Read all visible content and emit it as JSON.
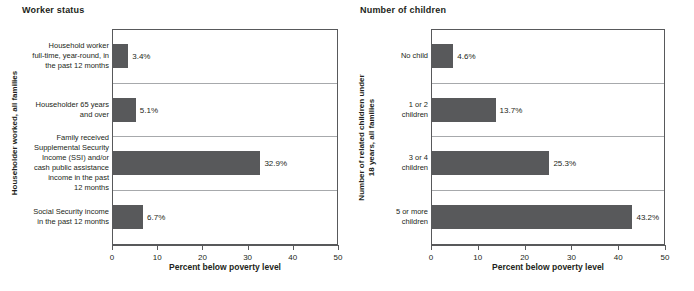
{
  "chart_data": [
    {
      "type": "bar",
      "title": "Worker status",
      "orientation": "horizontal",
      "categories": [
        "Household worker\nfull-time, year-round, in\nthe past 12 months",
        "Householder 65 years\nand over",
        "Family received\nSupplemental Security\nIncome (SSI) and/or\ncash public assistance\nincome in the past\n12 months",
        "Social Security income\nin the past 12 months"
      ],
      "values": [
        3.4,
        5.1,
        32.9,
        6.7
      ],
      "data_labels": [
        "3.4%",
        "5.1%",
        "32.9%",
        "6.7%"
      ],
      "xlabel": "Percent below poverty level",
      "ylabel": "Householder worked, all families",
      "xlim": [
        0,
        50
      ],
      "xticks": [
        0,
        10,
        20,
        30,
        40,
        50
      ],
      "xtick_labels": [
        "0",
        "10",
        "20",
        "30",
        "40",
        "50"
      ],
      "grid": "horizontal-category-separators",
      "legend": "none",
      "bar_color": "#58595b"
    },
    {
      "type": "bar",
      "title": "Number of children",
      "orientation": "horizontal",
      "categories": [
        "No child",
        "1 or 2\nchildren",
        "3 or 4\nchildren",
        "5 or more\nchildren"
      ],
      "values": [
        4.6,
        13.7,
        25.3,
        43.2
      ],
      "data_labels": [
        "4.6%",
        "13.7%",
        "25.3%",
        "43.2%"
      ],
      "xlabel": "Percent below poverty level",
      "ylabel": "Number of related children under\n18 years, all families",
      "xlim": [
        0,
        50
      ],
      "xticks": [
        0,
        10,
        20,
        30,
        40,
        50
      ],
      "xtick_labels": [
        "0",
        "10",
        "20",
        "30",
        "40",
        "50"
      ],
      "grid": "horizontal-category-separators",
      "legend": "none",
      "bar_color": "#58595b"
    }
  ],
  "colors": {
    "bar": "#58595b",
    "axis": "#58595b",
    "gridline": "#a7a9ac",
    "text": "#231f20",
    "background": "#ffffff"
  }
}
